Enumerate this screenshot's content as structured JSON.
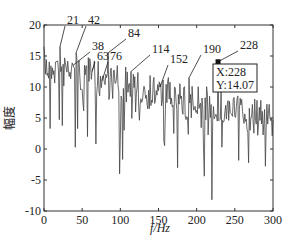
{
  "chart_data": {
    "type": "line",
    "title": "",
    "xlabel": "f/Hz",
    "ylabel": "幅度",
    "xlim": [
      0,
      300
    ],
    "ylim": [
      -10,
      20
    ],
    "xticks": [
      0,
      50,
      100,
      150,
      200,
      250,
      300
    ],
    "yticks": [
      -10,
      -5,
      0,
      5,
      10,
      15,
      20
    ],
    "grid": false,
    "legend": null,
    "annotations": [
      {
        "label": "21",
        "x": 21,
        "y": 16.5
      },
      {
        "label": "42",
        "x": 42,
        "y": 15.5
      },
      {
        "label": "38",
        "x": 38,
        "y": 13.5
      },
      {
        "label": "63",
        "x": 63,
        "y": 12.5
      },
      {
        "label": "76",
        "x": 76,
        "y": 11.0
      },
      {
        "label": "84",
        "x": 84,
        "y": 15.5
      },
      {
        "label": "114",
        "x": 114,
        "y": 12.5
      },
      {
        "label": "152",
        "x": 152,
        "y": 10.0
      },
      {
        "label": "190",
        "x": 190,
        "y": 11.5
      },
      {
        "label": "228",
        "x": 228,
        "y": 14.07
      }
    ],
    "datatip": {
      "x_label": "X:228",
      "y_label": "Y:14.07",
      "x": 228,
      "y": 14.07
    },
    "peaks": [
      {
        "f": 21,
        "amp": 16.5
      },
      {
        "f": 38,
        "amp": 13.5
      },
      {
        "f": 42,
        "amp": 15.5
      },
      {
        "f": 63,
        "amp": 12.5
      },
      {
        "f": 76,
        "amp": 11.0
      },
      {
        "f": 84,
        "amp": 15.5
      },
      {
        "f": 114,
        "amp": 12.5
      },
      {
        "f": 152,
        "amp": 10.0
      },
      {
        "f": 190,
        "amp": 11.5
      },
      {
        "f": 228,
        "amp": 14.07
      }
    ],
    "series_description": "Noisy amplitude spectrum decreasing from ~17 near 0 Hz to ~7 at 300 Hz with deep negative dips down to about -8 near 220 Hz"
  },
  "labels": {
    "xlabel": "f/Hz",
    "ylabel": "幅度",
    "tip_x": "X:228",
    "tip_y": "Y:14.07"
  }
}
